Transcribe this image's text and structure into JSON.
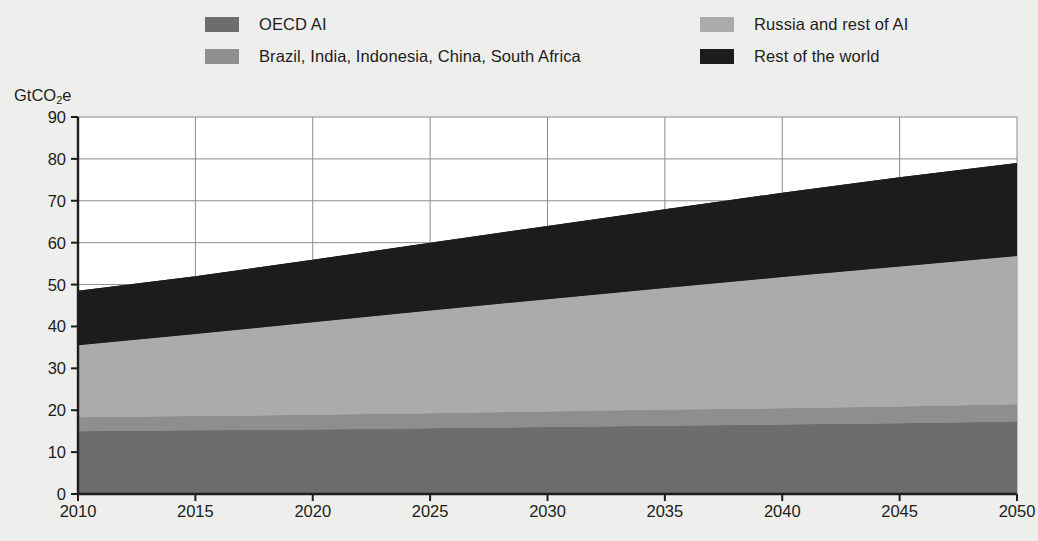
{
  "legend": {
    "items": [
      {
        "label": "OECD AI",
        "color": "#6d6d6d",
        "swatch_name": "legend-swatch-oecd"
      },
      {
        "label": "Brazil, India, Indonesia, China, South Africa",
        "color": "#8e8e8e",
        "swatch_name": "legend-swatch-biics"
      },
      {
        "label": "Russia and rest of AI",
        "color": "#ababab",
        "swatch_name": "legend-swatch-russia"
      },
      {
        "label": "Rest of the world",
        "color": "#1c1c1c",
        "swatch_name": "legend-swatch-row"
      }
    ]
  },
  "axes": {
    "y_title": "GtCO",
    "y_title_sub": "2",
    "y_title_suffix": "e",
    "y_ticks": [
      0,
      10,
      20,
      30,
      40,
      50,
      60,
      70,
      80,
      90
    ],
    "x_ticks": [
      2010,
      2015,
      2020,
      2025,
      2030,
      2035,
      2040,
      2045,
      2050
    ]
  },
  "chart_data": {
    "type": "area",
    "title": "",
    "xlabel": "",
    "ylabel": "GtCO2e",
    "xlim": [
      2010,
      2050
    ],
    "ylim": [
      0,
      90
    ],
    "grid": true,
    "legend_position": "top",
    "stacked": true,
    "x": [
      2010,
      2015,
      2020,
      2025,
      2030,
      2035,
      2040,
      2045,
      2050
    ],
    "series": [
      {
        "name": "OECD AI",
        "color": "#6d6d6d",
        "values": [
          15.0,
          15.2,
          15.4,
          15.7,
          16.0,
          16.3,
          16.6,
          16.9,
          17.3
        ]
      },
      {
        "name": "Brazil, India, Indonesia, China, South Africa",
        "color": "#8e8e8e",
        "values": [
          3.3,
          3.4,
          3.5,
          3.6,
          3.7,
          3.8,
          3.9,
          4.0,
          4.1
        ]
      },
      {
        "name": "Russia and rest of AI",
        "color": "#ababab",
        "values": [
          17.2,
          19.6,
          22.1,
          24.5,
          26.8,
          29.1,
          31.3,
          33.4,
          35.4
        ]
      },
      {
        "name": "Rest of the world",
        "color": "#1c1c1c",
        "values": [
          13.0,
          13.8,
          14.9,
          16.2,
          17.5,
          18.8,
          20.1,
          21.3,
          22.2
        ]
      }
    ],
    "cumulative_totals": [
      48.5,
      52.0,
      55.9,
      60.0,
      64.0,
      68.0,
      71.9,
      75.6,
      79.0
    ],
    "units": "GtCO2e"
  }
}
